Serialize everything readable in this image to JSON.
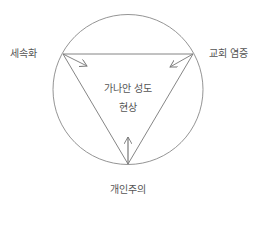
{
  "diagram": {
    "labels": {
      "left_vertex": "세속화",
      "right_vertex": "교회 염증",
      "bottom_vertex": "개인주의",
      "center_line1": "가나안 성도",
      "center_line2": "현상"
    },
    "nodes": [
      {
        "id": "secularization",
        "label": "세속화",
        "position": "left"
      },
      {
        "id": "church-fatigue",
        "label": "교회 염증",
        "position": "right"
      },
      {
        "id": "individualism",
        "label": "개인주의",
        "position": "bottom"
      }
    ],
    "center": {
      "id": "canaan-saints-phenomenon",
      "label": "가나안 성도 현상"
    },
    "edges": [
      {
        "from": "secularization",
        "to": "canaan-saints-phenomenon",
        "type": "arrow"
      },
      {
        "from": "church-fatigue",
        "to": "canaan-saints-phenomenon",
        "type": "arrow"
      },
      {
        "from": "individualism",
        "to": "canaan-saints-phenomenon",
        "type": "arrow"
      }
    ],
    "colors": {
      "stroke": "#777777",
      "text": "#555555"
    }
  }
}
